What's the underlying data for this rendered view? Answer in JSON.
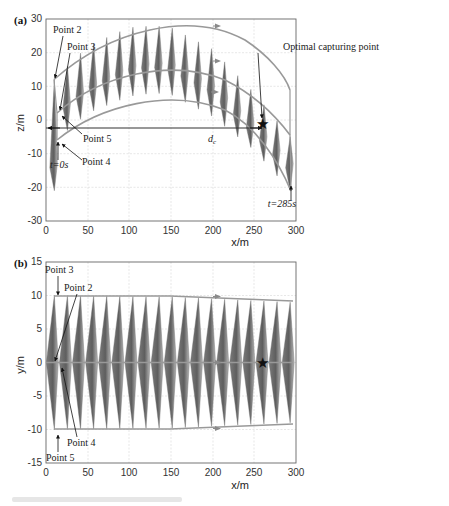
{
  "chart_data": [
    {
      "panel": "(a)",
      "type": "line",
      "title": "",
      "xlabel": "x/m",
      "ylabel": "z/m",
      "xlim": [
        0,
        300
      ],
      "ylim": [
        -30,
        30
      ],
      "xticks": [
        0,
        50,
        100,
        150,
        200,
        250,
        300
      ],
      "yticks": [
        -30,
        -20,
        -10,
        0,
        10,
        20,
        30
      ],
      "grid": true,
      "series": [
        {
          "name": "upper trajectory (Point 2)",
          "x": [
            10,
            50,
            100,
            130,
            150,
            200,
            250,
            293
          ],
          "y": [
            12,
            22,
            27.5,
            28,
            27.5,
            21,
            8,
            -5
          ]
        },
        {
          "name": "middle trajectory (Point 3)",
          "x": [
            12,
            50,
            100,
            130,
            150,
            200,
            250,
            293
          ],
          "y": [
            2,
            10,
            16,
            17,
            16.5,
            10,
            -2,
            -13
          ]
        },
        {
          "name": "lower trajectory (Point 4/5)",
          "x": [
            12,
            50,
            100,
            130,
            150,
            200,
            250,
            293
          ],
          "y": [
            -6,
            2,
            7,
            8,
            7.5,
            1,
            -9,
            -21
          ]
        },
        {
          "name": "d_c baseline",
          "x": [
            0,
            262
          ],
          "y": [
            -2,
            -2
          ]
        }
      ],
      "markers": [
        {
          "name": "Optimal capturing point",
          "x": 262,
          "y": -1,
          "symbol": "star"
        }
      ],
      "annotations": [
        "Point 2",
        "Point 3",
        "Point 5",
        "Point 4",
        "t=0s",
        "t=285s",
        "Optimal capturing point",
        "d_c"
      ],
      "num_snapshots": 19
    },
    {
      "panel": "(b)",
      "type": "line",
      "title": "",
      "xlabel": "x/m",
      "ylabel": "y/m",
      "xlim": [
        0,
        300
      ],
      "ylim": [
        -15,
        15
      ],
      "xticks": [
        0,
        50,
        100,
        150,
        200,
        250,
        300
      ],
      "yticks": [
        -15,
        -10,
        -5,
        0,
        5,
        10,
        15
      ],
      "grid": true,
      "series": [
        {
          "name": "upper boundary (Point 3)",
          "x": [
            10,
            150,
            293
          ],
          "y": [
            10,
            9.8,
            9
          ]
        },
        {
          "name": "centerline",
          "x": [
            0,
            293
          ],
          "y": [
            0,
            0
          ]
        },
        {
          "name": "lower boundary (Point 5)",
          "x": [
            10,
            150,
            293
          ],
          "y": [
            -10,
            -9.8,
            -9
          ]
        }
      ],
      "markers": [
        {
          "name": "Optimal capturing point",
          "x": 262,
          "y": 0,
          "symbol": "star"
        }
      ],
      "annotations": [
        "Point 3",
        "Point 2",
        "Point 4",
        "Point 5"
      ],
      "num_snapshots": 19
    }
  ],
  "panel_a": {
    "label": "(a)",
    "xlabel": "x/m",
    "ylabel": "z/m",
    "xticks": [
      "0",
      "50",
      "100",
      "150",
      "200",
      "250",
      "300"
    ],
    "yticks": [
      "30",
      "20",
      "10",
      "0",
      "-10",
      "-20",
      "-30"
    ],
    "annotations": {
      "point2": "Point 2",
      "point3": "Point 3",
      "point5": "Point 5",
      "point4": "Point 4",
      "t0": "t=0s",
      "tend": "t=285s",
      "optimal": "Optimal capturing point",
      "dc": "d",
      "dc_sub": "c"
    }
  },
  "panel_b": {
    "label": "(b)",
    "xlabel": "x/m",
    "ylabel": "y/m",
    "xticks": [
      "0",
      "50",
      "100",
      "150",
      "200",
      "250",
      "300"
    ],
    "yticks": [
      "15",
      "10",
      "5",
      "0",
      "-5",
      "-10",
      "-15"
    ],
    "annotations": {
      "point3": "Point 3",
      "point2": "Point 2",
      "point4": "Point 4",
      "point5": "Point 5"
    }
  },
  "colors": {
    "trajectory": "#9a9a9a",
    "snapshot_dark": "#6e6e6e",
    "snapshot_light": "#b4b4b4",
    "grid": "#d9d9d9",
    "axis": "#555555",
    "marker": "#111111"
  }
}
